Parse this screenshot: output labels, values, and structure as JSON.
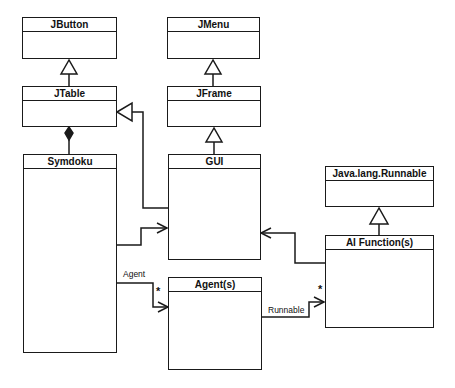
{
  "diagram": {
    "type": "uml-class-diagram",
    "classes": [
      {
        "id": "jbutton",
        "name": "JButton"
      },
      {
        "id": "jtable",
        "name": "JTable"
      },
      {
        "id": "symdoku",
        "name": "Symdoku"
      },
      {
        "id": "jmenu",
        "name": "JMenu"
      },
      {
        "id": "jframe",
        "name": "JFrame"
      },
      {
        "id": "gui",
        "name": "GUI"
      },
      {
        "id": "runnable",
        "name": "Java.lang.Runnable"
      },
      {
        "id": "ai",
        "name": "AI Function(s)"
      },
      {
        "id": "agents",
        "name": "Agent(s)"
      }
    ],
    "relationships": [
      {
        "from": "JTable",
        "to": "JButton",
        "type": "generalization"
      },
      {
        "from": "Symdoku",
        "to": "JTable",
        "type": "composition"
      },
      {
        "from": "JFrame",
        "to": "JMenu",
        "type": "generalization"
      },
      {
        "from": "GUI",
        "to": "JFrame",
        "type": "generalization"
      },
      {
        "from": "GUI",
        "to": "JTable",
        "type": "generalization"
      },
      {
        "from": "Symdoku",
        "to": "GUI",
        "type": "association"
      },
      {
        "from": "Symdoku",
        "to": "Agent(s)",
        "type": "association",
        "label": "Agent",
        "multiplicity": "*"
      },
      {
        "from": "Agent(s)",
        "to": "AI Function(s)",
        "type": "association",
        "label": "Runnable",
        "multiplicity": "*"
      },
      {
        "from": "AI Function(s)",
        "to": "GUI",
        "type": "association"
      },
      {
        "from": "AI Function(s)",
        "to": "Java.lang.Runnable",
        "type": "realization"
      }
    ],
    "labels": {
      "agent_assoc": "Agent",
      "runnable_assoc": "Runnable",
      "agent_mult": "*",
      "ai_mult": "*"
    }
  }
}
